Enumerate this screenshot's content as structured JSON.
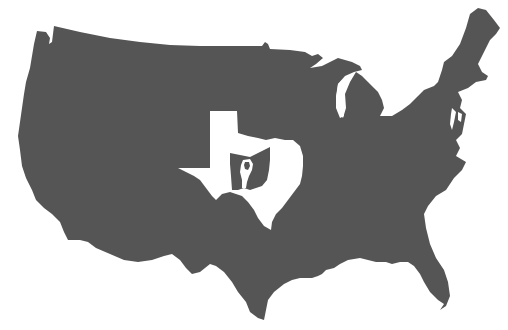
{
  "map": {
    "title": "Nested state silhouettes",
    "description": "Silhouette of the contiguous United States containing a white Texas, which contains a dark Ohio, which contains a white Vermont, which contains a dark tiny state",
    "colors": {
      "background": "#ffffff",
      "land_dark": "#555555",
      "cutout_light": "#ffffff"
    },
    "layers": [
      {
        "name": "Contiguous United States",
        "fill": "dark"
      },
      {
        "name": "Texas",
        "fill": "light"
      },
      {
        "name": "Ohio",
        "fill": "dark"
      },
      {
        "name": "Vermont",
        "fill": "light"
      },
      {
        "name": "Rhode Island",
        "fill": "dark"
      }
    ]
  }
}
